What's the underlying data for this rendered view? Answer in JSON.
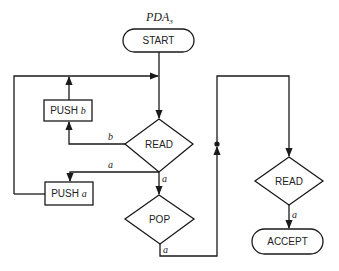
{
  "diagram": {
    "title": "PDA",
    "title_subscript": "3",
    "nodes": {
      "start": {
        "label": "START",
        "shape": "rounded-rect"
      },
      "read_main": {
        "label": "READ",
        "shape": "diamond"
      },
      "push_b": {
        "label": "PUSH",
        "symbol": "b",
        "shape": "rect"
      },
      "push_a": {
        "label": "PUSH",
        "symbol": "a",
        "shape": "rect"
      },
      "pop": {
        "label": "POP",
        "shape": "diamond"
      },
      "read_final": {
        "label": "READ",
        "shape": "diamond"
      },
      "accept": {
        "label": "ACCEPT",
        "shape": "rounded-rect"
      }
    },
    "edges": [
      {
        "from": "start",
        "to": "read_main",
        "label": ""
      },
      {
        "from": "read_main",
        "to": "push_b",
        "label": "b"
      },
      {
        "from": "read_main",
        "to": "push_a",
        "label": "a"
      },
      {
        "from": "read_main",
        "to": "pop",
        "label": "a"
      },
      {
        "from": "push_b",
        "to": "read_main",
        "label": ""
      },
      {
        "from": "push_a",
        "to": "read_main",
        "label": ""
      },
      {
        "from": "pop",
        "to": "read_final",
        "label": "a"
      },
      {
        "from": "read_final",
        "to": "accept",
        "label": "a"
      }
    ],
    "edge_labels": {
      "read_to_push_b": "b",
      "read_to_push_a": "a",
      "read_to_pop": "a",
      "pop_out": "a",
      "read_final_to_accept": "a"
    },
    "stroke_color": "#1a1a1a",
    "background": "#ffffff"
  }
}
